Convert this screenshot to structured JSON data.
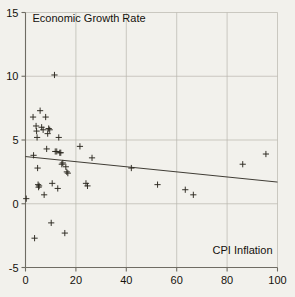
{
  "chart_data": {
    "type": "scatter",
    "title": "",
    "xlabel": "CPI Inflation",
    "ylabel": "Economic Growth Rate",
    "xlim": [
      0,
      100
    ],
    "ylim": [
      -5,
      15
    ],
    "xticks": [
      0,
      20,
      40,
      60,
      80,
      100
    ],
    "yticks": [
      -5,
      0,
      5,
      10,
      15
    ],
    "xtick_labels": [
      "0",
      "20",
      "40",
      "60",
      "80",
      "100"
    ],
    "ytick_labels": [
      "-5",
      "0",
      "5",
      "10",
      "15"
    ],
    "grid": true,
    "grid_color": "#b9b6ad",
    "marker": "plus",
    "marker_color": "#2b2820",
    "axis_color": "#6f6c63",
    "background": "#f2f1ec",
    "legend": null,
    "points": [
      {
        "x": 0.3,
        "y": 0.4
      },
      {
        "x": 3.0,
        "y": 6.8
      },
      {
        "x": 3.2,
        "y": 3.8
      },
      {
        "x": 3.6,
        "y": -2.7
      },
      {
        "x": 4.2,
        "y": 6.1
      },
      {
        "x": 4.4,
        "y": 5.7
      },
      {
        "x": 4.6,
        "y": 5.2
      },
      {
        "x": 4.8,
        "y": 2.8
      },
      {
        "x": 5.0,
        "y": 1.5
      },
      {
        "x": 5.2,
        "y": 1.3
      },
      {
        "x": 5.4,
        "y": 1.4
      },
      {
        "x": 5.8,
        "y": 7.3
      },
      {
        "x": 6.4,
        "y": 6.0
      },
      {
        "x": 7.0,
        "y": 5.8
      },
      {
        "x": 7.4,
        "y": 0.7
      },
      {
        "x": 8.0,
        "y": 6.8
      },
      {
        "x": 8.4,
        "y": 4.3
      },
      {
        "x": 8.8,
        "y": 5.5
      },
      {
        "x": 9.2,
        "y": 5.9
      },
      {
        "x": 9.6,
        "y": 5.8
      },
      {
        "x": 10.2,
        "y": -1.5
      },
      {
        "x": 10.6,
        "y": 1.6
      },
      {
        "x": 11.5,
        "y": 10.1
      },
      {
        "x": 11.8,
        "y": 4.1
      },
      {
        "x": 12.4,
        "y": 4.1
      },
      {
        "x": 12.8,
        "y": 1.2
      },
      {
        "x": 13.2,
        "y": 5.2
      },
      {
        "x": 13.6,
        "y": 4.0
      },
      {
        "x": 14.0,
        "y": 4.0
      },
      {
        "x": 14.4,
        "y": 3.1
      },
      {
        "x": 14.8,
        "y": 3.2
      },
      {
        "x": 15.6,
        "y": -2.3
      },
      {
        "x": 16.0,
        "y": 2.9
      },
      {
        "x": 16.4,
        "y": 2.5
      },
      {
        "x": 16.8,
        "y": 2.4
      },
      {
        "x": 21.6,
        "y": 4.5
      },
      {
        "x": 24.0,
        "y": 1.6
      },
      {
        "x": 24.6,
        "y": 1.4
      },
      {
        "x": 26.4,
        "y": 3.6
      },
      {
        "x": 42.0,
        "y": 2.8
      },
      {
        "x": 52.4,
        "y": 1.5
      },
      {
        "x": 63.4,
        "y": 1.1
      },
      {
        "x": 66.6,
        "y": 0.7
      },
      {
        "x": 86.2,
        "y": 3.1
      },
      {
        "x": 95.4,
        "y": 3.9
      }
    ],
    "trendline": {
      "type": "linear",
      "x_start": 0,
      "y_start": 3.7,
      "x_end": 100,
      "y_end": 1.7,
      "color": "#2b2820"
    }
  }
}
